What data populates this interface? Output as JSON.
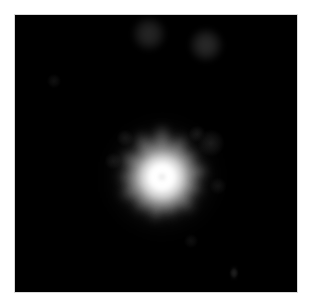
{
  "image": {
    "kind": "astronomical-observation",
    "description": "Near-infrared / optical image of a bright point-like source with an extended radially structured halo, on a black sky background",
    "width": 311,
    "height": 307,
    "page_background": "#ffffff",
    "sky_background": "#000000",
    "border_color": "#d8d8d8",
    "field": {
      "x": 14,
      "y": 14,
      "width": 284,
      "height": 279
    }
  },
  "colors": {
    "core_white": "#ffffff",
    "core_inner": "#f2f2f2",
    "halo_bright": "#cfcfcf",
    "halo_mid": "#8a8a8a",
    "halo_faint": "#4a4a4a",
    "halo_outer": "#242424",
    "companion": "#2a2a2a",
    "sky": "#000000"
  },
  "objects": {
    "primary": {
      "name": "central-source",
      "label": "central bright source",
      "center_x": 161,
      "center_y": 176,
      "core_radius": 13,
      "halo_radius": 58,
      "peak_brightness": 255,
      "morphology": "point source with radially spiked extended halo",
      "spike_count": 13
    },
    "companions": [
      {
        "name": "companion-upper-left",
        "center_x": 148,
        "center_y": 33,
        "radius": 11,
        "brightness": 38,
        "label": "faint companion A"
      },
      {
        "name": "companion-upper-right",
        "center_x": 205,
        "center_y": 44,
        "radius": 11,
        "brightness": 42,
        "label": "faint companion B"
      }
    ],
    "faint_features": [
      {
        "name": "faint-knot-left",
        "center_x": 53,
        "center_y": 80,
        "radius": 4,
        "brightness": 16,
        "label": "faint knot"
      },
      {
        "name": "faint-smudge-east",
        "center_x": 210,
        "center_y": 142,
        "radius": 8,
        "brightness": 26,
        "label": "faint elongated smudge east"
      },
      {
        "name": "faint-knot-northeast",
        "center_x": 196,
        "center_y": 133,
        "radius": 5,
        "brightness": 22,
        "label": "faint knot northeast"
      },
      {
        "name": "faint-knot-northwest",
        "center_x": 124,
        "center_y": 137,
        "radius": 5,
        "brightness": 20,
        "label": "faint knot northwest"
      },
      {
        "name": "faint-knot-west",
        "center_x": 112,
        "center_y": 160,
        "radius": 5,
        "brightness": 18,
        "label": "faint knot west"
      },
      {
        "name": "faint-knot-southeast",
        "center_x": 217,
        "center_y": 185,
        "radius": 5,
        "brightness": 17,
        "label": "faint knot southeast"
      },
      {
        "name": "faint-knot-south",
        "center_x": 190,
        "center_y": 240,
        "radius": 4,
        "brightness": 14,
        "label": "faint knot south"
      },
      {
        "name": "faint-streak-lower-right",
        "center_x": 233,
        "center_y": 272,
        "radius": 3,
        "brightness": 20,
        "label": "faint vertical streak"
      }
    ],
    "halo_spikes": [
      {
        "angle": 90,
        "length": 54,
        "width": 19,
        "brightness": 92,
        "label": "spike-n"
      },
      {
        "angle": 62,
        "length": 50,
        "width": 18,
        "brightness": 86,
        "label": "spike-nne"
      },
      {
        "angle": 34,
        "length": 46,
        "width": 17,
        "brightness": 80,
        "label": "spike-ne"
      },
      {
        "angle": 8,
        "length": 49,
        "width": 18,
        "brightness": 84,
        "label": "spike-e"
      },
      {
        "angle": -20,
        "length": 45,
        "width": 17,
        "brightness": 78,
        "label": "spike-ese"
      },
      {
        "angle": -48,
        "length": 48,
        "width": 18,
        "brightness": 82,
        "label": "spike-se"
      },
      {
        "angle": -74,
        "length": 44,
        "width": 16,
        "brightness": 76,
        "label": "spike-sse"
      },
      {
        "angle": -100,
        "length": 47,
        "width": 18,
        "brightness": 80,
        "label": "spike-s"
      },
      {
        "angle": -128,
        "length": 45,
        "width": 17,
        "brightness": 78,
        "label": "spike-ssw"
      },
      {
        "angle": -154,
        "length": 48,
        "width": 18,
        "brightness": 82,
        "label": "spike-sw"
      },
      {
        "angle": 180,
        "length": 46,
        "width": 17,
        "brightness": 79,
        "label": "spike-w"
      },
      {
        "angle": 152,
        "length": 49,
        "width": 18,
        "brightness": 84,
        "label": "spike-nw"
      },
      {
        "angle": 118,
        "length": 52,
        "width": 19,
        "brightness": 88,
        "label": "spike-nnw"
      }
    ]
  }
}
